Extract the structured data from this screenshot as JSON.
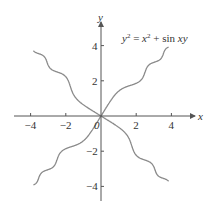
{
  "chart_data": {
    "type": "line",
    "equation": "y^2 = x^2 + sin(xy)",
    "xlabel": "x",
    "ylabel": "y",
    "xlim": [
      -4.8,
      5.3
    ],
    "ylim": [
      -4.8,
      5.3
    ],
    "x_ticks": [
      -4,
      -2,
      0,
      2,
      4
    ],
    "x_tick_labels": [
      "−4",
      "−2",
      "0",
      "2",
      "4"
    ],
    "y_ticks": [
      -4,
      -2,
      2,
      4
    ],
    "y_tick_labels": [
      "−4",
      "−2",
      "2",
      "4"
    ],
    "grid": false,
    "legend": null,
    "curve_color": "#8a8a8a",
    "axis_color": "#555555",
    "series": [
      {
        "name": "branch-increasing",
        "x": [
          -3.8,
          -3,
          -2,
          -1,
          0,
          1,
          2,
          3,
          3.8
        ],
        "y": [
          -4.0,
          -3.1,
          -1.9,
          -1.0,
          0,
          1.0,
          1.9,
          3.1,
          4.0
        ]
      },
      {
        "name": "branch-decreasing",
        "x": [
          -3.8,
          -3,
          -2,
          -1,
          0,
          1,
          2,
          3,
          3.8
        ],
        "y": [
          4.0,
          3.0,
          2.1,
          1.3,
          0,
          -1.3,
          -2.1,
          -3.0,
          -4.0
        ]
      }
    ]
  }
}
